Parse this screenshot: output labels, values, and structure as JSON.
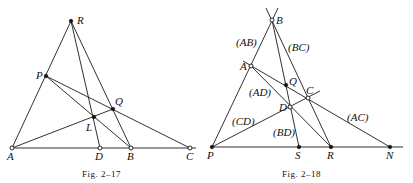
{
  "figures": [
    {
      "caption": "Fig. 2–17",
      "points": {
        "R": {
          "label": "R",
          "x": 71,
          "y": 21,
          "style": "filled"
        },
        "P": {
          "label": "P",
          "x": 46,
          "y": 76,
          "style": "filled"
        },
        "Q": {
          "label": "Q",
          "x": 113,
          "y": 109,
          "style": "filled"
        },
        "L": {
          "label": "L",
          "x": 94,
          "y": 117,
          "style": "filled"
        },
        "A": {
          "label": "A",
          "x": 12,
          "y": 148,
          "style": "open"
        },
        "D": {
          "label": "D",
          "x": 100,
          "y": 148,
          "style": "open"
        },
        "B": {
          "label": "B",
          "x": 131,
          "y": 148,
          "style": "open"
        },
        "C": {
          "label": "C",
          "x": 190,
          "y": 148,
          "style": "open"
        }
      },
      "segments": [
        [
          "A",
          "C"
        ],
        [
          "A",
          "R"
        ],
        [
          "R",
          "D"
        ],
        [
          "R",
          "B"
        ],
        [
          "P",
          "C"
        ],
        [
          "P",
          "B"
        ],
        [
          "A",
          "Q"
        ]
      ]
    },
    {
      "caption": "Fig. 2–18",
      "points": {
        "B": {
          "label": "B",
          "x": 272,
          "y": 20,
          "style": "open"
        },
        "A": {
          "label": "A",
          "x": 251,
          "y": 66,
          "style": "open"
        },
        "Q": {
          "label": "Q",
          "x": 286,
          "y": 85,
          "style": "filled"
        },
        "C": {
          "label": "C",
          "x": 308,
          "y": 98,
          "style": "open"
        },
        "D": {
          "label": "D",
          "x": 290,
          "y": 107,
          "style": "open"
        },
        "P": {
          "label": "P",
          "x": 212,
          "y": 147,
          "style": "filled"
        },
        "S": {
          "label": "S",
          "x": 299,
          "y": 147,
          "style": "filled"
        },
        "R": {
          "label": "R",
          "x": 331,
          "y": 147,
          "style": "filled"
        },
        "N": {
          "label": "N",
          "x": 390,
          "y": 147,
          "style": "filled"
        }
      },
      "line_labels": {
        "AB": "(AB)",
        "BC": "(BC)",
        "AD": "(AD)",
        "CD": "(CD)",
        "BD": "(BD)",
        "AC": "(AC)"
      }
    }
  ]
}
